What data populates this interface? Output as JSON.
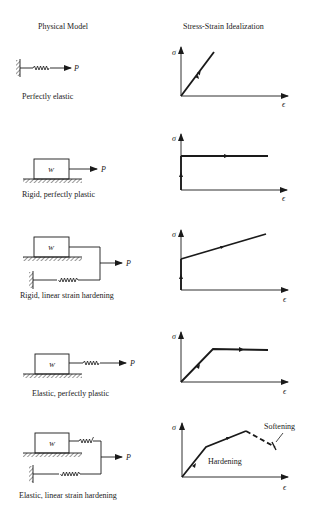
{
  "headers": {
    "physical_model": "Physical Model",
    "stress_strain": "Stress-Strain Idealization"
  },
  "rows": [
    {
      "caption": "Perfectly elastic",
      "force_label": "P",
      "y_axis": "σ",
      "x_axis": "ϵ"
    },
    {
      "caption": "Rigid, perfectly plastic",
      "force_label": "P",
      "block_label": "W",
      "y_axis": "σ",
      "x_axis": "ϵ"
    },
    {
      "caption": "Rigid, linear strain hardening",
      "force_label": "P",
      "block_label": "W",
      "y_axis": "σ",
      "x_axis": "ϵ"
    },
    {
      "caption": "Elastic, perfectly plastic",
      "force_label": "P",
      "block_label": "W",
      "y_axis": "σ",
      "x_axis": "ϵ"
    },
    {
      "caption": "Elastic, linear strain hardening",
      "force_label": "P",
      "block_label": "W",
      "y_axis": "σ",
      "x_axis": "ϵ",
      "annotations": {
        "hardening": "Hardening",
        "softening": "Softening"
      }
    }
  ],
  "colors": {
    "ink": "#1a1a1a",
    "background": "#ffffff"
  }
}
